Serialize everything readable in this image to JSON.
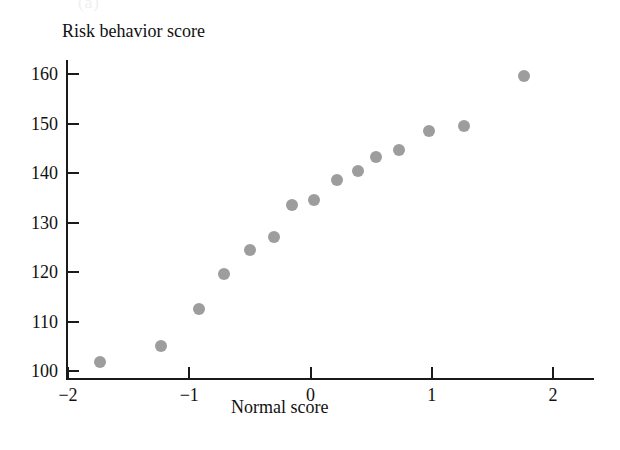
{
  "figure": {
    "panel_label": "(a)",
    "point_color": "#9d9d9d",
    "axis_color": "#1a1a1a",
    "background": "#ffffff"
  },
  "chart_data": {
    "type": "scatter",
    "title": "",
    "xlabel": "Normal score",
    "ylabel": "Risk behavior score",
    "xlim": [
      -2.15,
      2.3
    ],
    "ylim": [
      98.5,
      162.5
    ],
    "xticks": [
      -2,
      -1,
      0,
      1,
      2
    ],
    "xtick_labels": [
      "−2",
      "−1",
      "0",
      "1",
      "2"
    ],
    "yticks": [
      100,
      110,
      120,
      130,
      140,
      150,
      160
    ],
    "ytick_labels": [
      "100",
      "110",
      "120",
      "130",
      "140",
      "150",
      "160"
    ],
    "grid": false,
    "legend": "none",
    "marker": "filled-circle",
    "n_points": 15,
    "points": [
      {
        "x": -1.74,
        "y": 101.8
      },
      {
        "x": -1.23,
        "y": 105.0
      },
      {
        "x": -0.92,
        "y": 112.5
      },
      {
        "x": -0.71,
        "y": 119.5
      },
      {
        "x": -0.5,
        "y": 124.5
      },
      {
        "x": -0.3,
        "y": 127.0
      },
      {
        "x": -0.15,
        "y": 133.5
      },
      {
        "x": 0.03,
        "y": 134.5
      },
      {
        "x": 0.22,
        "y": 138.6
      },
      {
        "x": 0.39,
        "y": 140.5
      },
      {
        "x": 0.54,
        "y": 143.3
      },
      {
        "x": 0.73,
        "y": 144.7
      },
      {
        "x": 0.98,
        "y": 148.5
      },
      {
        "x": 1.27,
        "y": 149.5
      },
      {
        "x": 1.76,
        "y": 159.5
      }
    ]
  }
}
